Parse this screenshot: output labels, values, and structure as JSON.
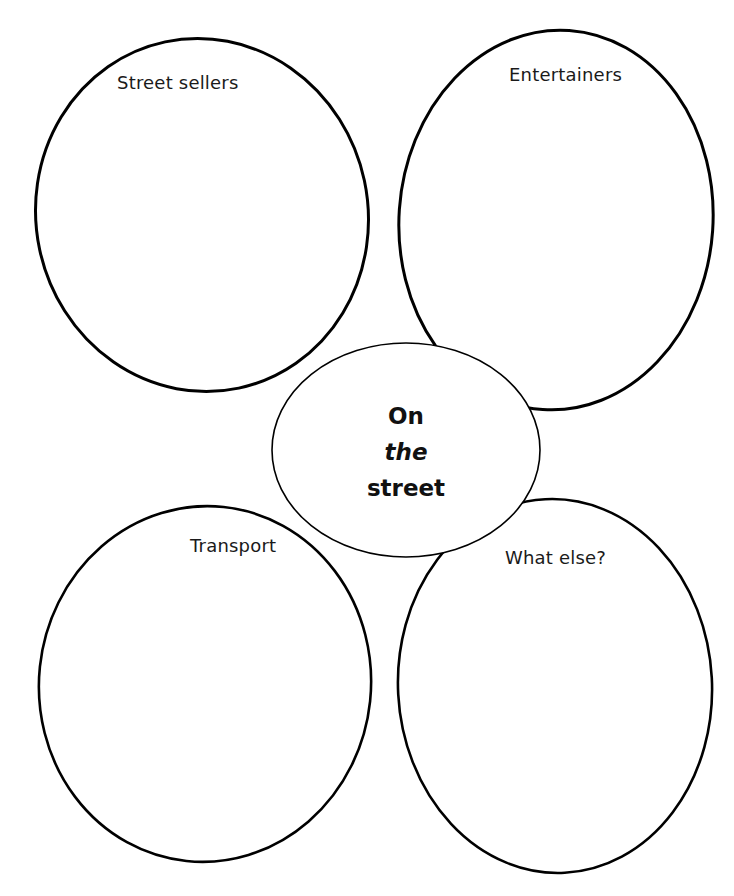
{
  "diagram": {
    "type": "spider-diagram",
    "center": {
      "lines": [
        "On",
        "the",
        "street"
      ],
      "full_text": "On the street"
    },
    "bubbles": [
      {
        "id": "top-left",
        "label": "Street sellers"
      },
      {
        "id": "top-right",
        "label": "Entertainers"
      },
      {
        "id": "bottom-left",
        "label": "Transport"
      },
      {
        "id": "bottom-right",
        "label": "What else?"
      }
    ],
    "colors": {
      "stroke": "#000000",
      "background": "#ffffff",
      "text": "#1a1a1a"
    }
  }
}
